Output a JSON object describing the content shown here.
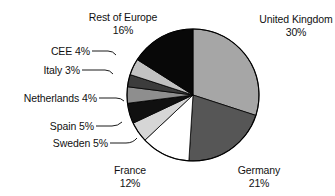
{
  "chart_data": {
    "type": "pie",
    "title": "",
    "subtitle": "",
    "xlabel": "",
    "ylabel": "",
    "legend_position": "none",
    "grid": false,
    "units": "percent",
    "total": 100,
    "start_angle_deg": 0,
    "direction": "clockwise",
    "categories": [
      "United Kingdom",
      "Germany",
      "France",
      "Sweden",
      "Spain",
      "Netherlands",
      "Italy",
      "CEE",
      "Rest of Europe"
    ],
    "values": [
      30,
      21,
      12,
      5,
      5,
      4,
      3,
      4,
      16
    ],
    "slices": [
      {
        "name": "United Kingdom",
        "value": 30,
        "pct_label": "30%",
        "color": "#a6a6a6"
      },
      {
        "name": "Germany",
        "value": 21,
        "pct_label": "21%",
        "color": "#565656"
      },
      {
        "name": "France",
        "value": 12,
        "pct_label": "12%",
        "color": "#ffffff"
      },
      {
        "name": "Sweden",
        "value": 5,
        "pct_label": "5%",
        "color": "#d6d6d6"
      },
      {
        "name": "Spain",
        "value": 5,
        "pct_label": "5%",
        "color": "#101010"
      },
      {
        "name": "Netherlands",
        "value": 4,
        "pct_label": "4%",
        "color": "#8e8e8e"
      },
      {
        "name": "Italy",
        "value": 3,
        "pct_label": "3%",
        "color": "#3c3c3c"
      },
      {
        "name": "CEE",
        "value": 4,
        "pct_label": "4%",
        "color": "#c2c2c2"
      },
      {
        "name": "Rest of Europe",
        "value": 16,
        "pct_label": "16%",
        "color": "#080808"
      }
    ],
    "colors": {
      "outline": "#000000",
      "text": "#111111",
      "background": "#ffffff",
      "leader_line": "#000000"
    }
  },
  "labels": {
    "united_kingdom": {
      "name": "United Kingdom",
      "pct": "30%"
    },
    "germany": {
      "name": "Germany",
      "pct": "21%"
    },
    "france": {
      "name": "France",
      "pct": "12%"
    },
    "sweden": {
      "name": "Sweden",
      "pct": "5%"
    },
    "spain": {
      "name": "Spain",
      "pct": "5%"
    },
    "netherlands": {
      "name": "Netherlands",
      "pct": "4%"
    },
    "italy": {
      "name": "Italy",
      "pct": "3%"
    },
    "cee": {
      "name": "CEE",
      "pct": "4%"
    },
    "rest_of_europe": {
      "name": "Rest of Europe",
      "pct": "16%"
    }
  }
}
